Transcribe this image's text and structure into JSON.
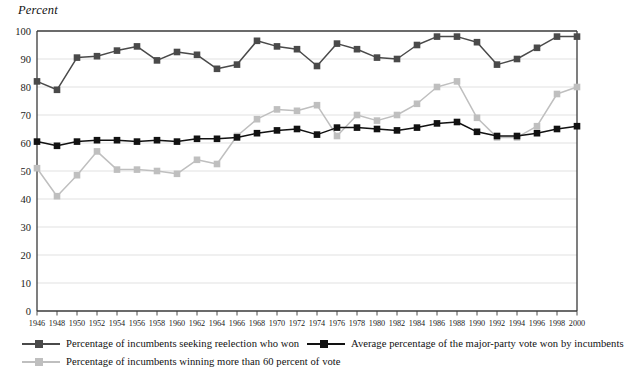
{
  "axis_title": "Percent",
  "legend": {
    "items": [
      {
        "label": "Percentage of incumbents seeking reelection who won",
        "color": "#4a4a4a",
        "key": "won"
      },
      {
        "label": "Average percentage of the major-party vote won by incumbents",
        "color": "#121212",
        "key": "vote"
      },
      {
        "label": "Percentage of incumbents winning more than 60 percent of vote",
        "color": "#bfbfbf",
        "key": "sixty"
      }
    ]
  },
  "chart_data": {
    "type": "line",
    "title": "",
    "xlabel": "",
    "ylabel": "Percent",
    "ylim": [
      0,
      100
    ],
    "ytick_step": 10,
    "grid": true,
    "legend_position": "bottom",
    "x": [
      1946,
      1948,
      1950,
      1952,
      1954,
      1956,
      1958,
      1960,
      1962,
      1964,
      1966,
      1968,
      1970,
      1972,
      1974,
      1976,
      1978,
      1980,
      1982,
      1984,
      1986,
      1988,
      1990,
      1992,
      1994,
      1996,
      1998,
      2000
    ],
    "xtick_labels": [
      "1946",
      "1948",
      "1950",
      "1952",
      "1954",
      "1956",
      "1958",
      "1960",
      "1962",
      "1964",
      "1966",
      "1968",
      "1970",
      "1972",
      "1974",
      "1976",
      "1978",
      "1980",
      "1982",
      "1984",
      "1986",
      "1988",
      "1990",
      "1992",
      "1994",
      "1996",
      "1998",
      "2000"
    ],
    "ytick_labels": [
      "0",
      "10",
      "20",
      "30",
      "40",
      "50",
      "60",
      "70",
      "80",
      "90",
      "100"
    ],
    "series": [
      {
        "name": "Percentage of incumbents seeking reelection who won",
        "color": "#4a4a4a",
        "values": [
          82,
          79,
          90.5,
          91,
          93,
          94.5,
          89.5,
          92.5,
          91.5,
          86.5,
          88,
          96.5,
          94.5,
          93.5,
          87.5,
          95.5,
          93.5,
          90.5,
          90,
          95,
          98,
          98,
          96,
          88,
          90,
          94,
          98,
          98
        ]
      },
      {
        "name": "Average percentage of the major-party vote won by incumbents",
        "color": "#121212",
        "values": [
          60.5,
          59,
          60.5,
          61,
          61,
          60.5,
          61,
          60.5,
          61.5,
          61.5,
          62,
          63.5,
          64.5,
          65,
          63,
          65.5,
          65.5,
          65,
          64.5,
          65.5,
          67,
          67.5,
          64,
          62.5,
          62.5,
          63.5,
          65,
          66
        ]
      },
      {
        "name": "Percentage of incumbents winning more than 60 percent of vote",
        "color": "#bfbfbf",
        "values": [
          51,
          41,
          48.5,
          57,
          50.5,
          50.5,
          50,
          49,
          54,
          52.5,
          62.5,
          68.5,
          72,
          71.5,
          73.5,
          62.5,
          70,
          68,
          70,
          74,
          80,
          82,
          69,
          62,
          62,
          66,
          77.5,
          80
        ]
      }
    ]
  }
}
